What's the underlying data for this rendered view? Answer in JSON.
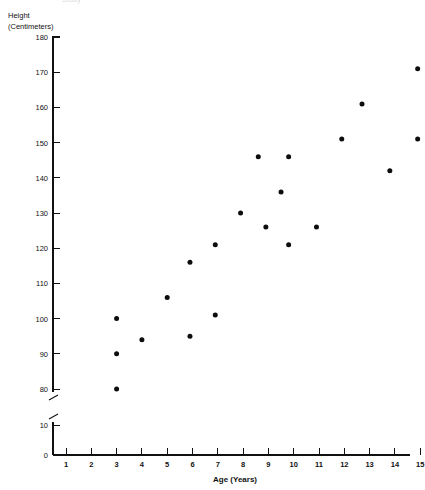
{
  "header": {
    "cropped_title": "Study"
  },
  "axes": {
    "y_caption_line1": "Height",
    "y_caption_line2": "(Centimeters)",
    "x_caption": "Age (Years)",
    "y_ticks": [
      "180",
      "170",
      "160",
      "150",
      "140",
      "130",
      "120",
      "110",
      "100",
      "90",
      "80",
      "10",
      "0"
    ],
    "x_ticks": [
      "1",
      "2",
      "3",
      "4",
      "5",
      "6",
      "7",
      "8",
      "9",
      "10",
      "11",
      "12",
      "13",
      "14",
      "15"
    ],
    "has_axis_break": true,
    "break_between": [
      "80",
      "10"
    ]
  },
  "colors": {
    "point": "#0d0d0d",
    "axis": "#111111",
    "background": "#ffffff"
  },
  "chart_data": {
    "type": "scatter",
    "title": "",
    "xlabel": "Age (Years)",
    "ylabel": "Height (Centimeters)",
    "xlim": [
      0,
      15.4
    ],
    "ylim": [
      0,
      180
    ],
    "y_axis_break": {
      "from": 20,
      "to": 75
    },
    "grid": false,
    "legend": null,
    "xticks": [
      1,
      2,
      3,
      4,
      5,
      6,
      7,
      8,
      9,
      10,
      11,
      12,
      13,
      14,
      15
    ],
    "yticks": [
      0,
      10,
      80,
      90,
      100,
      110,
      120,
      130,
      140,
      150,
      160,
      170,
      180
    ],
    "series": [
      {
        "name": "Height by Age",
        "points": [
          {
            "x": 3.0,
            "y": 100
          },
          {
            "x": 3.0,
            "y": 90
          },
          {
            "x": 3.0,
            "y": 80
          },
          {
            "x": 4.0,
            "y": 94
          },
          {
            "x": 5.0,
            "y": 106
          },
          {
            "x": 5.9,
            "y": 116
          },
          {
            "x": 5.9,
            "y": 95
          },
          {
            "x": 6.9,
            "y": 121
          },
          {
            "x": 6.9,
            "y": 101
          },
          {
            "x": 7.9,
            "y": 130
          },
          {
            "x": 8.6,
            "y": 146
          },
          {
            "x": 8.9,
            "y": 126
          },
          {
            "x": 9.5,
            "y": 136
          },
          {
            "x": 9.8,
            "y": 146
          },
          {
            "x": 9.8,
            "y": 121
          },
          {
            "x": 10.9,
            "y": 126
          },
          {
            "x": 11.9,
            "y": 151
          },
          {
            "x": 12.7,
            "y": 161
          },
          {
            "x": 13.8,
            "y": 142
          },
          {
            "x": 14.9,
            "y": 171
          },
          {
            "x": 14.9,
            "y": 151
          }
        ]
      }
    ]
  }
}
